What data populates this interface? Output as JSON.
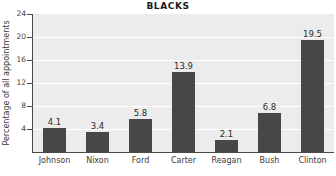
{
  "chart_data": {
    "type": "bar",
    "title": "BLACKS",
    "xlabel": "",
    "ylabel": "Percentage of all appointments",
    "categories": [
      "Johnson",
      "Nixon",
      "Ford",
      "Carter",
      "Reagan",
      "Bush",
      "Clinton"
    ],
    "values": [
      4.1,
      3.4,
      5.8,
      13.9,
      2.1,
      6.8,
      19.5
    ],
    "value_labels": [
      "4.1",
      "3.4",
      "5.8",
      "13.9",
      "2.1",
      "6.8",
      "19.5"
    ],
    "ylim": [
      0,
      24
    ],
    "yticks": [
      4,
      8,
      12,
      16,
      20,
      24
    ],
    "ytick_labels": [
      "4",
      "8",
      "12",
      "16",
      "20",
      "24"
    ],
    "grid": "horizontal",
    "legend": "none",
    "colors": {
      "bar": "#474747",
      "plot_background": "#ececec",
      "gridline": "#ffffff",
      "axis": "#4a4a4a",
      "page_background": "#ffffff",
      "text": "#2b2b2b"
    }
  }
}
